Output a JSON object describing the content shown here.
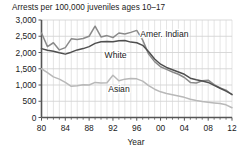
{
  "chart_data": {
    "type": "line",
    "title": "Arrests per 100,000 juveniles ages 10–17",
    "xlabel": "Year",
    "ylabel": "",
    "xlim": [
      1980,
      2012
    ],
    "ylim": [
      0,
      3000
    ],
    "grid": true,
    "legend_position": "inline-annotations",
    "ytick_labels": [
      "3,000",
      "2,500",
      "2,000",
      "1,500",
      "1,000",
      "500",
      "0"
    ],
    "ytick_values": [
      3000,
      2500,
      2000,
      1500,
      1000,
      500,
      0
    ],
    "xtick_labels": [
      "80",
      "84",
      "88",
      "92",
      "96",
      "00",
      "04",
      "08",
      "12"
    ],
    "xtick_values": [
      1980,
      1984,
      1988,
      1992,
      1996,
      2000,
      2004,
      2008,
      2012
    ],
    "x": [
      1980,
      1981,
      1982,
      1983,
      1984,
      1985,
      1986,
      1987,
      1988,
      1989,
      1990,
      1991,
      1992,
      1993,
      1994,
      1995,
      1996,
      1997,
      1998,
      1999,
      2000,
      2001,
      2002,
      2003,
      2004,
      2005,
      2006,
      2007,
      2008,
      2009,
      2010,
      2011,
      2012
    ],
    "series": [
      {
        "name": "Amer. Indian",
        "color": "#8a8a8a",
        "values": [
          2600,
          2180,
          2300,
          2080,
          2150,
          2420,
          2400,
          2430,
          2500,
          2810,
          2480,
          2520,
          2460,
          2600,
          2570,
          2620,
          2680,
          2380,
          1950,
          1720,
          1560,
          1480,
          1400,
          1330,
          1230,
          1080,
          1060,
          1130,
          1150,
          1010,
          910,
          840,
          700
        ]
      },
      {
        "name": "White",
        "color": "#4f4f4f",
        "values": [
          2120,
          2070,
          2040,
          1990,
          1950,
          2010,
          2080,
          2120,
          2180,
          2280,
          2330,
          2340,
          2330,
          2360,
          2370,
          2320,
          2300,
          2220,
          2020,
          1800,
          1640,
          1540,
          1470,
          1400,
          1330,
          1210,
          1160,
          1120,
          1080,
          990,
          900,
          810,
          710
        ]
      },
      {
        "name": "Asian",
        "color": "#b8b8b8",
        "values": [
          1500,
          1380,
          1250,
          1180,
          1080,
          960,
          980,
          1010,
          1000,
          1080,
          1060,
          1070,
          1300,
          1130,
          1180,
          1200,
          1190,
          1120,
          980,
          870,
          790,
          740,
          700,
          660,
          620,
          560,
          520,
          490,
          470,
          450,
          430,
          390,
          300
        ]
      }
    ]
  },
  "annotations": [
    {
      "text": "Amer. Indian",
      "x": 1996.6,
      "y": 2480
    },
    {
      "text": "White",
      "x": 1990.6,
      "y": 1830
    },
    {
      "text": "Asian",
      "x": 1991.2,
      "y": 790
    }
  ]
}
